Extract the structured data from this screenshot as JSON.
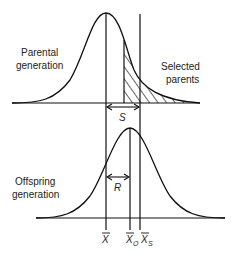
{
  "labels": {
    "parental_line1": "Parental",
    "parental_line2": "generation",
    "selected_line1": "Selected",
    "selected_line2": "parents",
    "offspring_line1": "Offspring",
    "offspring_line2": "generation",
    "selection_differential": "S",
    "response": "R",
    "mean_x": "X",
    "mean_xo": "X",
    "mean_xo_sub": "O",
    "mean_xs": "X",
    "mean_xs_sub": "S"
  },
  "colors": {
    "stroke": "#111111",
    "text": "#222222",
    "background": "#ffffff"
  }
}
